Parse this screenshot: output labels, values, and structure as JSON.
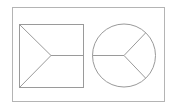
{
  "diagram": {
    "background": "#ffffff",
    "frame": {
      "x": 12.5,
      "y": 7.5,
      "width": 152,
      "height": 94,
      "stroke": "#b4b4b4"
    },
    "shapes": [
      {
        "name": "square-with-y-split",
        "type": "rect",
        "x": 19.5,
        "y": 24.5,
        "width": 64,
        "height": 63,
        "stroke": "#9a9a9a",
        "vertex": {
          "x": 51,
          "y": 55.5
        },
        "lines": [
          {
            "x1": 19.5,
            "y1": 24.5,
            "x2": 51,
            "y2": 55.5
          },
          {
            "x1": 19.5,
            "y1": 87.5,
            "x2": 51,
            "y2": 55.5
          },
          {
            "x1": 51,
            "y1": 55.5,
            "x2": 83.5,
            "y2": 55.5
          }
        ]
      },
      {
        "name": "circle-with-y-split",
        "type": "circle",
        "cx": 124,
        "cy": 55.5,
        "r": 31.5,
        "stroke": "#9a9a9a",
        "lines": [
          {
            "x1": 92.5,
            "y1": 55.5,
            "x2": 124,
            "y2": 55.5
          },
          {
            "x1": 124,
            "y1": 55.5,
            "x2": 145.5,
            "y2": 33
          },
          {
            "x1": 124,
            "y1": 55.5,
            "x2": 145.5,
            "y2": 78
          }
        ]
      }
    ]
  }
}
